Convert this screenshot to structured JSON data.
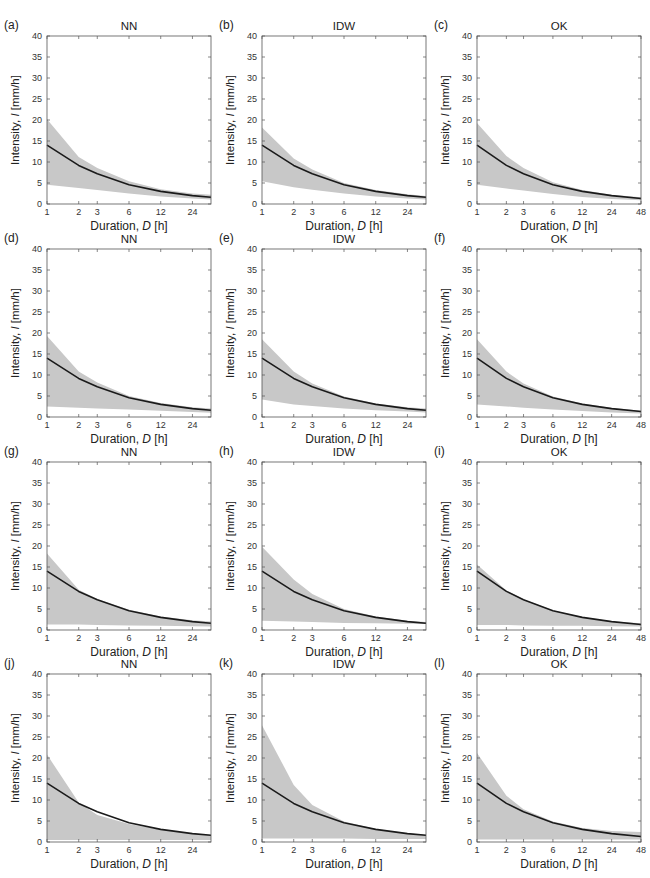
{
  "figure": {
    "columns": [
      "NN",
      "IDW",
      "OK"
    ],
    "xlabel_prefix": "Duration, ",
    "xlabel_var": "D",
    "xlabel_unit": " [h]",
    "ylabel_prefix": "Intensity, ",
    "ylabel_var": "I",
    "ylabel_unit": " [mm/h]",
    "band_color": "#c8c8c8",
    "line_color": "#1a1a1a",
    "axis_color": "#555555"
  },
  "chart_data": [
    {
      "type": "area",
      "panel": "(a)",
      "title": "NN",
      "xlabel": "Duration, D [h]",
      "ylabel": "Intensity, I [mm/h]",
      "xscale": "log",
      "xlim": [
        1,
        36
      ],
      "ylim": [
        0,
        40
      ],
      "xticks": [
        1,
        2,
        3,
        6,
        12,
        24
      ],
      "yticks": [
        0,
        5,
        10,
        15,
        20,
        25,
        30,
        35,
        40
      ],
      "x": [
        1,
        2,
        3,
        6,
        12,
        24,
        36
      ],
      "series": [
        {
          "name": "mean",
          "values": [
            14.0,
            9.2,
            7.2,
            4.6,
            3.0,
            2.0,
            1.6
          ]
        },
        {
          "name": "upper",
          "values": [
            20.2,
            11.2,
            8.6,
            5.4,
            3.5,
            2.5,
            2.2
          ]
        },
        {
          "name": "lower",
          "values": [
            4.6,
            3.8,
            3.3,
            2.5,
            1.8,
            1.3,
            1.1
          ]
        }
      ]
    },
    {
      "type": "area",
      "panel": "(b)",
      "title": "IDW",
      "xlabel": "Duration, D [h]",
      "ylabel": "Intensity, I [mm/h]",
      "xscale": "log",
      "xlim": [
        1,
        36
      ],
      "ylim": [
        0,
        40
      ],
      "xticks": [
        1,
        2,
        3,
        6,
        12,
        24
      ],
      "yticks": [
        0,
        5,
        10,
        15,
        20,
        25,
        30,
        35,
        40
      ],
      "x": [
        1,
        2,
        3,
        6,
        12,
        24,
        36
      ],
      "series": [
        {
          "name": "mean",
          "values": [
            14.0,
            9.2,
            7.2,
            4.6,
            3.0,
            2.0,
            1.6
          ]
        },
        {
          "name": "upper",
          "values": [
            18.2,
            10.8,
            8.2,
            5.0,
            3.3,
            2.3,
            1.9
          ]
        },
        {
          "name": "lower",
          "values": [
            5.4,
            4.0,
            3.4,
            2.5,
            1.8,
            1.3,
            1.1
          ]
        }
      ]
    },
    {
      "type": "area",
      "panel": "(c)",
      "title": "OK",
      "xlabel": "Duration, D [h]",
      "ylabel": "Intensity, I [mm/h]",
      "xscale": "log",
      "xlim": [
        1,
        48
      ],
      "ylim": [
        0,
        40
      ],
      "xticks": [
        1,
        2,
        3,
        6,
        12,
        24,
        48
      ],
      "yticks": [
        0,
        5,
        10,
        15,
        20,
        25,
        30,
        35,
        40
      ],
      "x": [
        1,
        2,
        3,
        6,
        12,
        24,
        48
      ],
      "series": [
        {
          "name": "mean",
          "values": [
            14.0,
            9.2,
            7.2,
            4.6,
            3.0,
            2.0,
            1.3
          ]
        },
        {
          "name": "upper",
          "values": [
            19.3,
            11.4,
            8.6,
            5.2,
            3.3,
            2.2,
            1.6
          ]
        },
        {
          "name": "lower",
          "values": [
            4.6,
            3.7,
            3.2,
            2.4,
            1.7,
            1.2,
            0.9
          ]
        }
      ]
    },
    {
      "type": "area",
      "panel": "(d)",
      "title": "NN",
      "xlabel": "Duration, D [h]",
      "ylabel": "Intensity, I [mm/h]",
      "xscale": "log",
      "xlim": [
        1,
        36
      ],
      "ylim": [
        0,
        40
      ],
      "xticks": [
        1,
        2,
        3,
        6,
        12,
        24
      ],
      "yticks": [
        0,
        5,
        10,
        15,
        20,
        25,
        30,
        35,
        40
      ],
      "x": [
        1,
        2,
        3,
        6,
        12,
        24,
        36
      ],
      "series": [
        {
          "name": "mean",
          "values": [
            14.0,
            9.2,
            7.2,
            4.6,
            3.0,
            2.0,
            1.6
          ]
        },
        {
          "name": "upper",
          "values": [
            19.3,
            10.8,
            8.2,
            5.0,
            3.3,
            2.3,
            2.0
          ]
        },
        {
          "name": "lower",
          "values": [
            2.5,
            2.2,
            2.0,
            1.8,
            1.5,
            1.2,
            1.0
          ]
        }
      ]
    },
    {
      "type": "area",
      "panel": "(e)",
      "title": "IDW",
      "xlabel": "Duration, D [h]",
      "ylabel": "Intensity, I [mm/h]",
      "xscale": "log",
      "xlim": [
        1,
        36
      ],
      "ylim": [
        0,
        40
      ],
      "xticks": [
        1,
        2,
        3,
        6,
        12,
        24
      ],
      "yticks": [
        0,
        5,
        10,
        15,
        20,
        25,
        30,
        35,
        40
      ],
      "x": [
        1,
        2,
        3,
        6,
        12,
        24,
        36
      ],
      "series": [
        {
          "name": "mean",
          "values": [
            14.0,
            9.2,
            7.2,
            4.6,
            3.0,
            2.0,
            1.6
          ]
        },
        {
          "name": "upper",
          "values": [
            18.5,
            10.8,
            8.0,
            4.9,
            3.2,
            2.3,
            2.0
          ]
        },
        {
          "name": "lower",
          "values": [
            4.2,
            3.0,
            2.6,
            2.0,
            1.6,
            1.3,
            1.1
          ]
        }
      ]
    },
    {
      "type": "area",
      "panel": "(f)",
      "title": "OK",
      "xlabel": "Duration, D [h]",
      "ylabel": "Intensity, I [mm/h]",
      "xscale": "log",
      "xlim": [
        1,
        48
      ],
      "ylim": [
        0,
        40
      ],
      "xticks": [
        1,
        2,
        3,
        6,
        12,
        24,
        48
      ],
      "yticks": [
        0,
        5,
        10,
        15,
        20,
        25,
        30,
        35,
        40
      ],
      "x": [
        1,
        2,
        3,
        6,
        12,
        24,
        48
      ],
      "series": [
        {
          "name": "mean",
          "values": [
            14.0,
            9.2,
            7.2,
            4.6,
            3.0,
            2.0,
            1.3
          ]
        },
        {
          "name": "upper",
          "values": [
            18.5,
            10.8,
            8.0,
            4.9,
            3.2,
            2.2,
            1.5
          ]
        },
        {
          "name": "lower",
          "values": [
            3.0,
            2.5,
            2.2,
            1.8,
            1.4,
            1.1,
            0.8
          ]
        }
      ]
    },
    {
      "type": "area",
      "panel": "(g)",
      "title": "NN",
      "xlabel": "Duration, D [h]",
      "ylabel": "Intensity, I [mm/h]",
      "xscale": "log",
      "xlim": [
        1,
        36
      ],
      "ylim": [
        0,
        40
      ],
      "xticks": [
        1,
        2,
        3,
        6,
        12,
        24
      ],
      "yticks": [
        0,
        5,
        10,
        15,
        20,
        25,
        30,
        35,
        40
      ],
      "x": [
        1,
        2,
        3,
        6,
        12,
        24,
        36
      ],
      "series": [
        {
          "name": "mean",
          "values": [
            14.0,
            9.2,
            7.2,
            4.6,
            3.0,
            2.0,
            1.6
          ]
        },
        {
          "name": "upper",
          "values": [
            18.2,
            9.6,
            7.4,
            4.8,
            3.2,
            2.3,
            2.0
          ]
        },
        {
          "name": "lower",
          "values": [
            1.3,
            1.3,
            1.2,
            1.1,
            1.0,
            0.9,
            0.8
          ]
        }
      ]
    },
    {
      "type": "area",
      "panel": "(h)",
      "title": "IDW",
      "xlabel": "Duration, D [h]",
      "ylabel": "Intensity, I [mm/h]",
      "xscale": "log",
      "xlim": [
        1,
        36
      ],
      "ylim": [
        0,
        40
      ],
      "xticks": [
        1,
        2,
        3,
        6,
        12,
        24
      ],
      "yticks": [
        0,
        5,
        10,
        15,
        20,
        25,
        30,
        35,
        40
      ],
      "x": [
        1,
        2,
        3,
        6,
        12,
        24,
        36
      ],
      "series": [
        {
          "name": "mean",
          "values": [
            14.0,
            9.2,
            7.2,
            4.6,
            3.0,
            2.0,
            1.6
          ]
        },
        {
          "name": "upper",
          "values": [
            19.8,
            12.0,
            8.6,
            5.0,
            3.2,
            2.2,
            1.9
          ]
        },
        {
          "name": "lower",
          "values": [
            2.2,
            2.0,
            1.9,
            1.7,
            1.6,
            1.5,
            1.4
          ]
        }
      ]
    },
    {
      "type": "area",
      "panel": "(i)",
      "title": "OK",
      "xlabel": "Duration, D [h]",
      "ylabel": "Intensity, I [mm/h]",
      "xscale": "log",
      "xlim": [
        1,
        48
      ],
      "ylim": [
        0,
        40
      ],
      "xticks": [
        1,
        2,
        3,
        6,
        12,
        24,
        48
      ],
      "yticks": [
        0,
        5,
        10,
        15,
        20,
        25,
        30,
        35,
        40
      ],
      "x": [
        1,
        2,
        3,
        6,
        12,
        24,
        48
      ],
      "series": [
        {
          "name": "mean",
          "values": [
            14.0,
            9.2,
            7.2,
            4.6,
            3.0,
            2.0,
            1.3
          ]
        },
        {
          "name": "upper",
          "values": [
            15.6,
            9.4,
            7.3,
            4.7,
            3.1,
            2.1,
            1.6
          ]
        },
        {
          "name": "lower",
          "values": [
            1.2,
            1.2,
            1.1,
            1.0,
            1.0,
            0.9,
            0.8
          ]
        }
      ]
    },
    {
      "type": "area",
      "panel": "(j)",
      "title": "NN",
      "xlabel": "Duration, D [h]",
      "ylabel": "Intensity, I [mm/h]",
      "xscale": "log",
      "xlim": [
        1,
        36
      ],
      "ylim": [
        0,
        40
      ],
      "xticks": [
        1,
        2,
        3,
        6,
        12,
        24
      ],
      "yticks": [
        0,
        5,
        10,
        15,
        20,
        25,
        30,
        35,
        40
      ],
      "x": [
        1,
        2,
        3,
        6,
        12,
        24,
        36
      ],
      "series": [
        {
          "name": "mean",
          "values": [
            14.0,
            9.2,
            7.2,
            4.6,
            3.0,
            2.0,
            1.6
          ]
        },
        {
          "name": "upper",
          "values": [
            20.8,
            9.4,
            6.4,
            4.3,
            2.9,
            2.0,
            1.7
          ]
        },
        {
          "name": "lower",
          "values": [
            0.5,
            0.5,
            0.5,
            0.5,
            0.5,
            0.5,
            0.5
          ]
        }
      ]
    },
    {
      "type": "area",
      "panel": "(k)",
      "title": "IDW",
      "xlabel": "Duration, D [h]",
      "ylabel": "Intensity, I [mm/h]",
      "xscale": "log",
      "xlim": [
        1,
        36
      ],
      "ylim": [
        0,
        40
      ],
      "xticks": [
        1,
        2,
        3,
        6,
        12,
        24
      ],
      "yticks": [
        0,
        5,
        10,
        15,
        20,
        25,
        30,
        35,
        40
      ],
      "x": [
        1,
        2,
        3,
        6,
        12,
        24,
        36
      ],
      "series": [
        {
          "name": "mean",
          "values": [
            14.0,
            9.2,
            7.2,
            4.6,
            3.0,
            2.0,
            1.6
          ]
        },
        {
          "name": "upper",
          "values": [
            27.8,
            13.6,
            8.8,
            4.9,
            3.1,
            2.1,
            1.7
          ]
        },
        {
          "name": "lower",
          "values": [
            0.8,
            0.8,
            0.8,
            0.8,
            0.7,
            0.7,
            0.7
          ]
        }
      ]
    },
    {
      "type": "area",
      "panel": "(l)",
      "title": "OK",
      "xlabel": "Duration, D [h]",
      "ylabel": "Intensity, I [mm/h]",
      "xscale": "log",
      "xlim": [
        1,
        48
      ],
      "ylim": [
        0,
        40
      ],
      "xticks": [
        1,
        2,
        3,
        6,
        12,
        24,
        48
      ],
      "yticks": [
        0,
        5,
        10,
        15,
        20,
        25,
        30,
        35,
        40
      ],
      "x": [
        1,
        2,
        3,
        6,
        12,
        24,
        48
      ],
      "series": [
        {
          "name": "mean",
          "values": [
            14.0,
            9.2,
            7.2,
            4.6,
            3.0,
            2.0,
            1.3
          ]
        },
        {
          "name": "upper",
          "values": [
            21.2,
            11.0,
            7.8,
            4.9,
            3.3,
            2.6,
            2.4
          ]
        },
        {
          "name": "lower",
          "values": [
            0.6,
            0.6,
            0.6,
            0.6,
            0.6,
            0.6,
            0.6
          ]
        }
      ]
    }
  ]
}
